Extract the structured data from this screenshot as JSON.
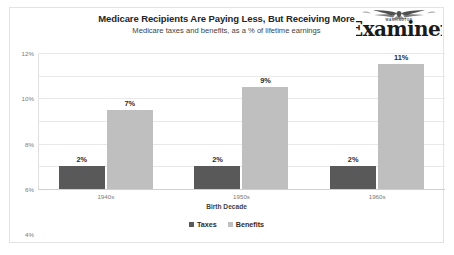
{
  "chart_data": {
    "type": "bar",
    "title": "Medicare Recipients Are Paying Less, But Receiving More",
    "subtitle": "Medicare taxes and benefits, as a % of lifetime earnings",
    "xlabel": "Birth Decade",
    "ylabel": "",
    "categories": [
      "1940s",
      "1950s",
      "1960s"
    ],
    "series": [
      {
        "name": "Taxes",
        "values": [
          2,
          2,
          2
        ],
        "color": "#595959",
        "labels": [
          "2%",
          "2%",
          "2%"
        ]
      },
      {
        "name": "Benefits",
        "values": [
          7,
          9,
          11
        ],
        "color": "#bfbfbf",
        "labels": [
          "7%",
          "9%",
          "11%"
        ]
      }
    ],
    "ylim": [
      0,
      12
    ],
    "y_tick_values": [
      0,
      2,
      4,
      6,
      8,
      10,
      12
    ],
    "y_tick_labels": [
      "0%",
      "2%",
      "4%",
      "6%",
      "8%",
      "10%",
      "12%"
    ],
    "grid": true,
    "legend_position": "bottom"
  },
  "masthead": {
    "kicker": "WASHINGTON",
    "name": "Examiner",
    "eagle_icon": "eagle-icon"
  }
}
